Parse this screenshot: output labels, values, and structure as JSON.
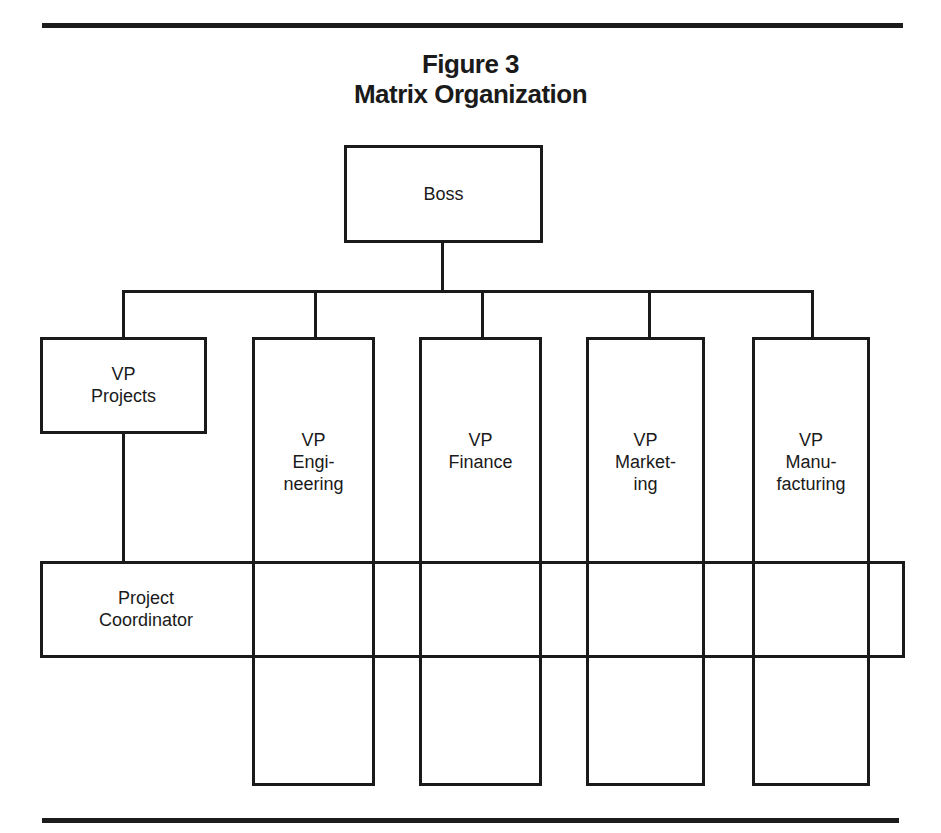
{
  "figure": {
    "number": "Figure 3",
    "title": "Matrix Organization"
  },
  "nodes": {
    "boss": {
      "label": "Boss"
    },
    "vp_projects": {
      "lines": [
        "VP",
        "Projects"
      ]
    },
    "vp_engineering": {
      "lines": [
        "VP",
        "Engi-",
        "neering"
      ]
    },
    "vp_finance": {
      "lines": [
        "VP",
        "Finance"
      ]
    },
    "vp_marketing": {
      "lines": [
        "VP",
        "Market-",
        "ing"
      ]
    },
    "vp_manufacturing": {
      "lines": [
        "VP",
        "Manu-",
        "facturing"
      ]
    },
    "project_coordinator": {
      "lines": [
        "Project",
        "Coordinator"
      ]
    }
  },
  "colors": {
    "ink": "#1a1a1a",
    "background": "#ffffff"
  }
}
